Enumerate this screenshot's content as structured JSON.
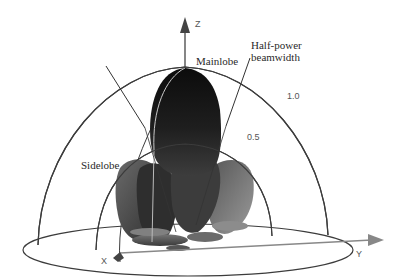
{
  "diagram": {
    "type": "3D antenna radiation pattern",
    "axes": {
      "z": "Z",
      "x": "X",
      "y": "Y"
    },
    "labels": {
      "mainlobe": "Mainlobe",
      "half_power_line1": "Half-power",
      "half_power_line2": "beamwidth",
      "sidelobe": "Sidelobe"
    },
    "scale_ticks": {
      "outer": "1.0",
      "inner": "0.5"
    },
    "colors": {
      "mainlobe_top": "#111111",
      "mainlobe_bottom": "#3a3a3a",
      "sidelobe": "#4a4a4a",
      "sidelobe_light": "#8a8a8a",
      "grid_lines": "#3c3c3c",
      "axis_arrow": "#444444",
      "y_axis_arrow": "#888888"
    }
  }
}
